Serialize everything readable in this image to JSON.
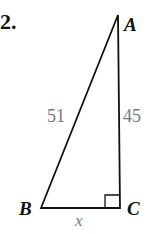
{
  "problem": {
    "number": "2."
  },
  "triangle": {
    "vertices": {
      "A": "A",
      "B": "B",
      "C": "C"
    },
    "sides": {
      "AB": "51",
      "AC": "45",
      "BC": "x"
    },
    "right_angle_at": "C",
    "colors": {
      "lines": "#111111",
      "side_labels": "#7a7a7a"
    }
  }
}
